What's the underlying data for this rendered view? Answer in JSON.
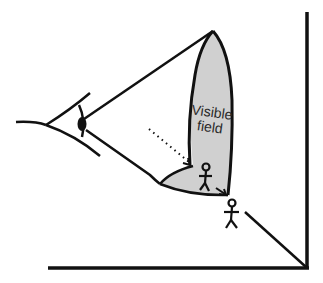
{
  "diagram": {
    "label_line1": "Visible",
    "label_line2": "field",
    "colors": {
      "stroke": "#111111",
      "field_fill": "#d0d0d0",
      "background": "#ffffff"
    },
    "elements": [
      "eye",
      "viewing-cone",
      "visible-field-region",
      "person-inside-field",
      "person-outside-field",
      "dotted-arrow",
      "wall",
      "floor",
      "ground-line"
    ]
  }
}
